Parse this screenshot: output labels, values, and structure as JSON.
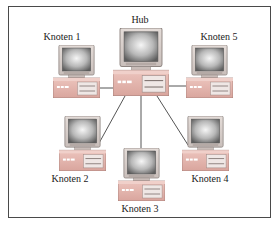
{
  "diagram": {
    "type": "star-network-topology",
    "center": {
      "id": "hub",
      "label": "Hub"
    },
    "nodes": [
      {
        "id": "knoten1",
        "label": "Knoten 1"
      },
      {
        "id": "knoten2",
        "label": "Knoten 2"
      },
      {
        "id": "knoten3",
        "label": "Knoten 3"
      },
      {
        "id": "knoten4",
        "label": "Knoten 4"
      },
      {
        "id": "knoten5",
        "label": "Knoten 5"
      }
    ],
    "edges": [
      {
        "from": "hub",
        "to": "knoten1"
      },
      {
        "from": "hub",
        "to": "knoten2"
      },
      {
        "from": "hub",
        "to": "knoten3"
      },
      {
        "from": "hub",
        "to": "knoten4"
      },
      {
        "from": "hub",
        "to": "knoten5"
      }
    ],
    "icon": "desktop-computer-icon",
    "colors": {
      "frame": "#4a4a4a",
      "link": "#555555",
      "case": "#e6b6b0",
      "monitor_bezel": "#d8d0cc",
      "screen_center": "#f4f4f4",
      "screen_edge": "#6a6a6a"
    }
  }
}
